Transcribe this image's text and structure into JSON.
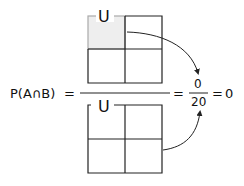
{
  "equation": {
    "lhs": "P(A∩B)",
    "equals1": "=",
    "equals2": "=",
    "equals3": "=",
    "numerator": "0",
    "denominator": "20",
    "result": "0"
  },
  "top_grid": {
    "label": "U",
    "rows": 2,
    "cols": 2,
    "highlighted_cell": "top-left",
    "highlight_color": "#eeeeee"
  },
  "bottom_grid": {
    "label": "U",
    "rows": 2,
    "cols": 2
  },
  "colors": {
    "line": "#222222",
    "highlight_border": "#aaaaaa",
    "highlight_fill": "#eeeeee"
  }
}
